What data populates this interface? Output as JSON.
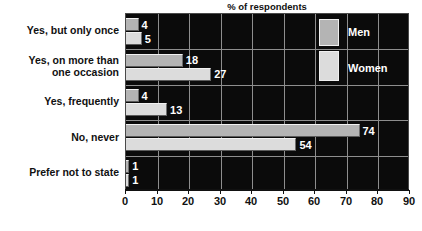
{
  "chart_data": {
    "type": "bar",
    "orientation": "horizontal",
    "title": "% of respondents",
    "xlabel": "",
    "ylabel": "",
    "xlim": [
      0,
      90
    ],
    "xticks": [
      0,
      10,
      20,
      30,
      40,
      50,
      60,
      70,
      80,
      90
    ],
    "grid": true,
    "legend_position": "inside-right",
    "categories": [
      "Yes, but only once",
      "Yes, on more than one occasion",
      "Yes, frequently",
      "No, never",
      "Prefer not to state"
    ],
    "category_label_lines": [
      [
        "Yes, but only once"
      ],
      [
        "Yes, on more than",
        "one occasion"
      ],
      [
        "Yes, frequently"
      ],
      [
        "No, never"
      ],
      [
        "Prefer not to state"
      ]
    ],
    "series": [
      {
        "name": "Men",
        "color": "#b4b4b4",
        "values": [
          4,
          18,
          4,
          74,
          1
        ]
      },
      {
        "name": "Women",
        "color": "#dcdcdc",
        "values": [
          5,
          27,
          13,
          54,
          1
        ]
      }
    ],
    "plot_background": "#0b0b0b",
    "gridline_color": "#8e8e8e",
    "value_label_color": "#ffffff"
  }
}
